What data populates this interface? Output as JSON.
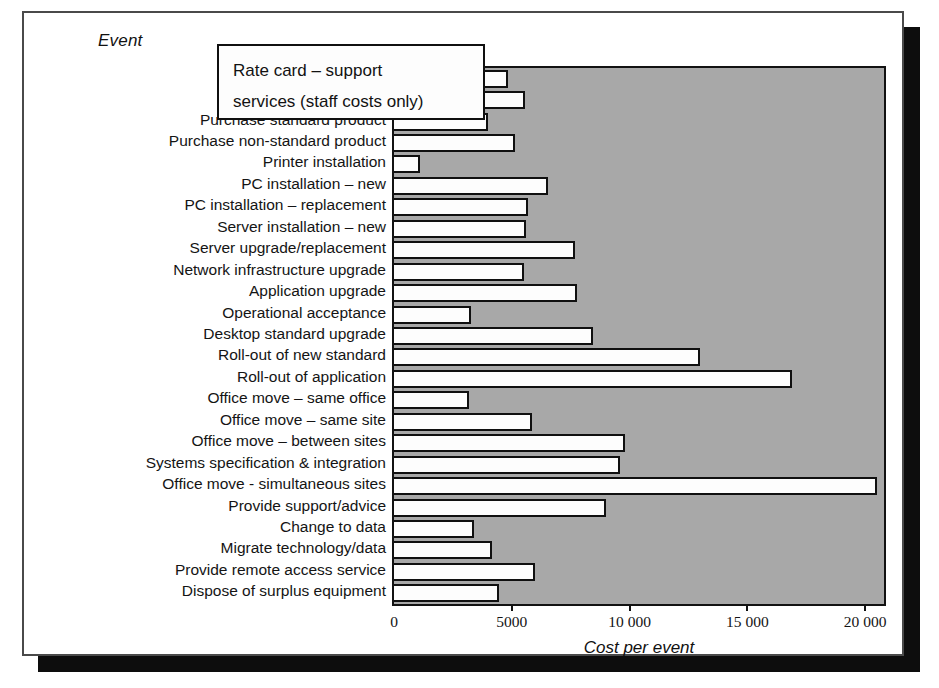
{
  "figure": {
    "y_axis_title": "Event",
    "x_axis_title": "Cost per event",
    "callout": {
      "line1": "Rate card – support",
      "line2": "services (staff costs only)"
    },
    "plot_background_color": "#a8a8a8",
    "bar_fill_color": "#fdfdfd",
    "bar_border_color": "#101010"
  },
  "chart_data": {
    "type": "bar",
    "orientation": "horizontal",
    "title": "Rate card – support services (staff costs only)",
    "xlabel": "Cost per event",
    "ylabel": "Event",
    "xlim": [
      0,
      20800
    ],
    "grid": false,
    "legend": "none",
    "xticks": [
      0,
      5000,
      10000,
      15000,
      20000
    ],
    "xticklabels": [
      "0",
      "5000",
      "10 000",
      "15 000",
      "20 000"
    ],
    "categories": [
      "Technical investigation",
      "Technical review",
      "Purchase standard product",
      "Purchase non-standard product",
      "Printer installation",
      "PC installation – new",
      "PC installation – replacement",
      "Server installation – new",
      "Server upgrade/replacement",
      "Network infrastructure upgrade",
      "Application upgrade",
      "Operational acceptance",
      "Desktop standard upgrade",
      "Roll-out of new standard",
      "Roll-out of application",
      "Office move – same office",
      "Office move – same site",
      "Office move – between sites",
      "Systems specification & integration",
      "Office move - simultaneous sites",
      "Provide support/advice",
      "Change to data",
      "Migrate technology/data",
      "Provide remote access service",
      "Dispose of surplus equipment"
    ],
    "values": [
      4850,
      5550,
      4000,
      5150,
      1100,
      6550,
      5700,
      5600,
      7700,
      5500,
      7750,
      3250,
      8450,
      13000,
      16900,
      3200,
      5850,
      9800,
      9600,
      20500,
      9000,
      3400,
      4150,
      6000,
      4450
    ]
  }
}
